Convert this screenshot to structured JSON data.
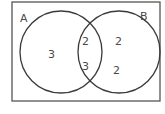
{
  "diagram": {
    "type": "venn",
    "sets": [
      {
        "label": "A"
      },
      {
        "label": "B"
      }
    ],
    "regions": {
      "a_only": "3",
      "a_and_b_top": "2",
      "a_and_b_bottom": "3",
      "b_only_top": "2",
      "b_only_bottom": "2"
    },
    "colors": {
      "stroke": "#3a3a3a",
      "frame": "#555555",
      "text": "#4a4a4a",
      "background": "#ffffff"
    }
  }
}
